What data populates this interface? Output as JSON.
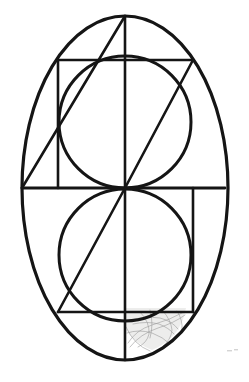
{
  "document": {
    "title": "Geometric Construction Drawing",
    "background_color": "#ffffff",
    "width": 249,
    "height": 382,
    "medium": "ink line drawing with pencil sketch annotation"
  },
  "palette": {
    "ink": "#151515",
    "sketch_pencil": "#9a9a9a",
    "sketch_shade": "#d8d6d4",
    "paper": "#ffffff"
  },
  "geometry": {
    "center": {
      "x": 125,
      "y": 188
    },
    "outer_ellipse": {
      "name": "outer-ellipse",
      "cx": 125,
      "cy": 188,
      "rx": 103,
      "ry": 172,
      "stroke_width": 3.2
    },
    "upper_circle": {
      "name": "upper-inner-circle",
      "cx": 125,
      "cy": 122,
      "r": 66,
      "stroke_width": 3.0
    },
    "lower_circle": {
      "name": "lower-inner-circle",
      "cx": 125,
      "cy": 255,
      "r": 66,
      "stroke_width": 3.0
    },
    "vertical_axis": {
      "name": "vertical-axis",
      "x": 125,
      "y1": 16,
      "y2": 360,
      "stroke_width": 2.6
    },
    "horizontal_diameter": {
      "name": "horizontal-diameter",
      "y": 188,
      "x1": 22,
      "x2": 225,
      "stroke_width": 2.8
    },
    "upper_chord": {
      "name": "upper-horizontal-chord",
      "y": 60,
      "x1": 58,
      "x2": 193,
      "stroke_width": 2.6
    },
    "lower_chord": {
      "name": "lower-horizontal-chord",
      "y": 312,
      "x1": 58,
      "x2": 193,
      "stroke_width": 2.6
    },
    "left_vertical": {
      "name": "left-vertical-segment",
      "x": 58,
      "y1": 60,
      "y2": 188,
      "stroke_width": 2.6
    },
    "right_vertical": {
      "name": "right-vertical-segment",
      "x": 193,
      "y1": 188,
      "y2": 312,
      "stroke_width": 2.6
    },
    "diagonal_upper": {
      "name": "upper-diagonal",
      "x1": 22,
      "y1": 188,
      "x2": 125,
      "y2": 16,
      "stroke_width": 2.6
    },
    "diagonal_center": {
      "name": "center-diagonal",
      "x1": 125,
      "y1": 188,
      "x2": 193,
      "y2": 60,
      "stroke_width": 2.6
    },
    "diagonal_lower": {
      "name": "lower-diagonal",
      "x1": 58,
      "y1": 312,
      "x2": 125,
      "y2": 188,
      "stroke_width": 2.6
    }
  },
  "annotation": {
    "sketch_region": {
      "name": "pencil-sketch-scribble",
      "description": "faint grey freehand pencil loops inside lower-right lune",
      "bounds": {
        "x": 126,
        "y": 304,
        "width": 60,
        "height": 46
      }
    },
    "corner_smudge": {
      "name": "corner-smudge",
      "x": 228,
      "y": 350
    }
  }
}
